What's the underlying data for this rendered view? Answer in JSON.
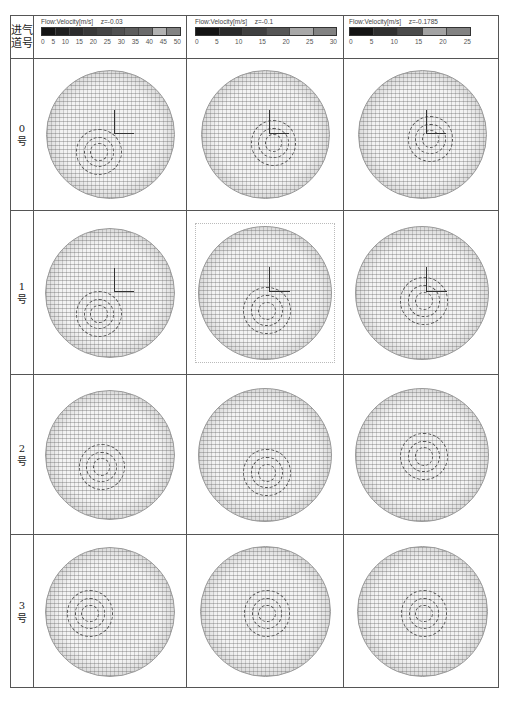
{
  "figure": {
    "corner_label": [
      "进气",
      "道号"
    ],
    "columns": [
      {
        "colorbar_title": "Flow:Velocity[m/s]",
        "plane": "z=-0.03",
        "ticks": [
          "0",
          "5",
          "10",
          "15",
          "20",
          "25",
          "30",
          "35",
          "40",
          "45",
          "50"
        ],
        "segments": 10
      },
      {
        "colorbar_title": "Flow:Velocity[m/s]",
        "plane": "z=-0.1",
        "ticks": [
          "0",
          "5",
          "10",
          "15",
          "20",
          "25",
          "30"
        ],
        "segments": 6
      },
      {
        "colorbar_title": "Flow:Velocity[m/s]",
        "plane": "z=-0.1785",
        "ticks": [
          "0",
          "5",
          "10",
          "15",
          "20",
          "25"
        ],
        "segments": 5
      }
    ],
    "rows": [
      {
        "num": "0",
        "suffix": "号",
        "plots": [
          "velocity vector field, swirl center lower-left, coordinate axes at center",
          "dense vector field with coordinate axes",
          "dense vector field with coordinate axes"
        ]
      },
      {
        "num": "1",
        "suffix": "号",
        "plots": [
          "velocity vector field, two vortices, coordinate axes",
          "vector field with dotted frame, vortex below center",
          "vector field with coordinate axes"
        ]
      },
      {
        "num": "2",
        "suffix": "号",
        "plots": [
          "S-shaped vector field",
          "vortex below center",
          "vortex at center"
        ]
      },
      {
        "num": "3",
        "suffix": "号",
        "plots": [
          "twin vortices",
          "vortex at center",
          "vortex at center"
        ]
      }
    ]
  },
  "colors": {
    "grid": "#555555",
    "colorbar_dark": "#111111",
    "colorbar_light": "#bbbbbb"
  }
}
